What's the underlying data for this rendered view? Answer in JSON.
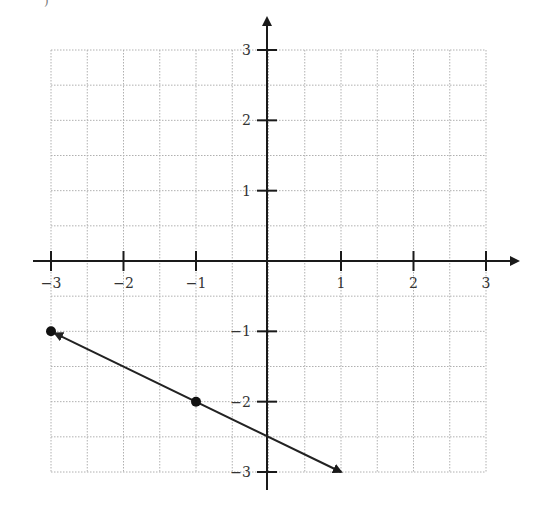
{
  "corner_text": ")",
  "chart_data": {
    "type": "line",
    "title": "",
    "xlabel": "",
    "ylabel": "",
    "xlim": [
      -3,
      3
    ],
    "ylim": [
      -3,
      3
    ],
    "grid": true,
    "grid_step": 0.5,
    "x_ticks": [
      -3,
      -2,
      -1,
      1,
      2,
      3
    ],
    "y_ticks": [
      3,
      2,
      1,
      -1,
      -2,
      -3
    ],
    "x_tick_labels": [
      "−3",
      "−2",
      "−1",
      "1",
      "2",
      "3"
    ],
    "y_tick_labels": [
      "3",
      "2",
      "1",
      "−1",
      "−2",
      "−3"
    ],
    "points": [
      {
        "x": -3,
        "y": -1
      },
      {
        "x": -1,
        "y": -2
      }
    ],
    "line": {
      "from": {
        "x": -3,
        "y": -1
      },
      "to": {
        "x": 1,
        "y": -3
      },
      "arrows": "both",
      "slope": -0.5,
      "intercept": -2.5
    },
    "legend": null
  },
  "colors": {
    "axis": "#1a1a1a",
    "grid": "#b0b0b0",
    "line": "#222222",
    "point": "#111111"
  }
}
